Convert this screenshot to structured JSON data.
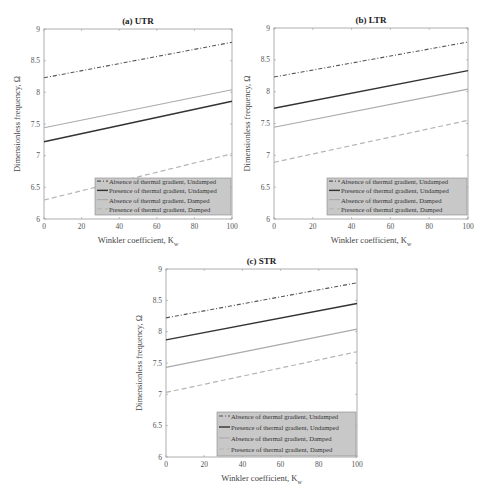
{
  "figure": {
    "legend_labels": [
      "Absence of thermal gradient, Undamped",
      "Presence of thermal gradient, Undamped",
      "Absence of thermal gradient, Damped",
      "Presence of thermal gradient, Damped"
    ]
  },
  "chart_data": [
    {
      "type": "line",
      "title": "(a) UTR",
      "xlabel": "Winkler coefficient, K_w",
      "ylabel": "Dimensionless frequency, Ω",
      "xlim": [
        0,
        100
      ],
      "ylim": [
        6,
        9
      ],
      "xticks": [
        "0",
        "20",
        "40",
        "60",
        "80",
        "100"
      ],
      "yticks": [
        "6",
        "6.5",
        "7",
        "7.5",
        "8",
        "8.5",
        "9"
      ],
      "grid": false,
      "legend_position": "lower right",
      "x": [
        0,
        100
      ],
      "series": [
        {
          "name": "Absence of thermal gradient, Undamped",
          "values": [
            8.23,
            8.79
          ],
          "style": "dashdot",
          "color": "#555555"
        },
        {
          "name": "Presence of thermal gradient, Undamped",
          "values": [
            7.22,
            7.86
          ],
          "style": "solid",
          "color": "#333333"
        },
        {
          "name": "Absence of thermal gradient, Damped",
          "values": [
            7.44,
            8.04
          ],
          "style": "solid",
          "color": "#aaaaaa"
        },
        {
          "name": "Presence of thermal gradient, Damped",
          "values": [
            6.3,
            7.03
          ],
          "style": "dashed",
          "color": "#b5b5b5"
        }
      ]
    },
    {
      "type": "line",
      "title": "(b) LTR",
      "xlabel": "Winkler coefficient, K_w",
      "ylabel": "Dimensionless frequency, Ω",
      "xlim": [
        0,
        100
      ],
      "ylim": [
        6,
        9
      ],
      "xticks": [
        "0",
        "20",
        "40",
        "60",
        "80",
        "100"
      ],
      "yticks": [
        "6",
        "6.5",
        "7",
        "7.5",
        "8",
        "8.5",
        "9"
      ],
      "grid": false,
      "legend_position": "lower right",
      "x": [
        0,
        100
      ],
      "series": [
        {
          "name": "Absence of thermal gradient, Undamped",
          "values": [
            8.23,
            8.78
          ],
          "style": "dashdot",
          "color": "#555555"
        },
        {
          "name": "Presence of thermal gradient, Undamped",
          "values": [
            7.74,
            8.33
          ],
          "style": "solid",
          "color": "#333333"
        },
        {
          "name": "Absence of thermal gradient, Damped",
          "values": [
            7.44,
            8.04
          ],
          "style": "solid",
          "color": "#aaaaaa"
        },
        {
          "name": "Presence of thermal gradient, Damped",
          "values": [
            6.89,
            7.55
          ],
          "style": "dashed",
          "color": "#b5b5b5"
        }
      ]
    },
    {
      "type": "line",
      "title": "(c) STR",
      "xlabel": "Winkler coefficient, K_w",
      "ylabel": "Dimensionless frequency, Ω",
      "xlim": [
        0,
        100
      ],
      "ylim": [
        6,
        9
      ],
      "xticks": [
        "0",
        "20",
        "40",
        "60",
        "80",
        "100"
      ],
      "yticks": [
        "6",
        "6.5",
        "7",
        "7.5",
        "8",
        "8.5",
        "9"
      ],
      "grid": false,
      "legend_position": "lower right",
      "x": [
        0,
        100
      ],
      "series": [
        {
          "name": "Absence of thermal gradient, Undamped",
          "values": [
            8.22,
            8.78
          ],
          "style": "dashdot",
          "color": "#555555"
        },
        {
          "name": "Presence of thermal gradient, Undamped",
          "values": [
            7.87,
            8.45
          ],
          "style": "solid",
          "color": "#333333"
        },
        {
          "name": "Absence of thermal gradient, Damped",
          "values": [
            7.43,
            8.04
          ],
          "style": "solid",
          "color": "#aaaaaa"
        },
        {
          "name": "Presence of thermal gradient, Damped",
          "values": [
            7.03,
            7.68
          ],
          "style": "dashed",
          "color": "#b5b5b5"
        }
      ]
    }
  ],
  "layout": {
    "panels": [
      {
        "left": 44,
        "top": 29,
        "right": 232,
        "bottom": 219,
        "legend": {
          "x": 95,
          "y": 178,
          "w": 136,
          "h": 37
        }
      },
      {
        "left": 274,
        "top": 28,
        "right": 468,
        "bottom": 219,
        "legend": {
          "x": 327,
          "y": 178,
          "w": 140,
          "h": 37
        }
      },
      {
        "left": 166,
        "top": 269,
        "right": 357,
        "bottom": 457,
        "legend": {
          "x": 217,
          "y": 412,
          "w": 139,
          "h": 44
        }
      }
    ],
    "legend_bg": "#c8c8c8",
    "axis_color": "#9a9a9a"
  }
}
